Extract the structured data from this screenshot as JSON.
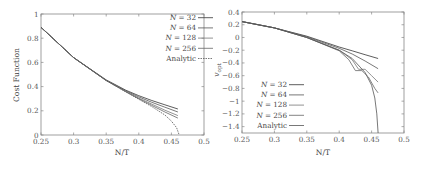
{
  "chart_data": [
    {
      "type": "line",
      "title": "",
      "xlabel": "N/T",
      "ylabel": "Cost Function",
      "xlim": [
        0.25,
        0.5
      ],
      "ylim": [
        0,
        1
      ],
      "xticks": [
        "0.25",
        "0.3",
        "0.35",
        "0.4",
        "0.45",
        "0.5"
      ],
      "yticks": [
        "0",
        "0.2",
        "0.4",
        "0.6",
        "0.8",
        "1"
      ],
      "grid": false,
      "legend_position": "upper right",
      "legend": [
        "N = 32",
        "N = 64",
        "N = 128",
        "N = 256",
        "Analytic"
      ],
      "series": [
        {
          "name": "N = 32",
          "style": "solid",
          "color": "#333333",
          "x": [
            0.25,
            0.3,
            0.35,
            0.38,
            0.4,
            0.42,
            0.44,
            0.46
          ],
          "y": [
            0.89,
            0.64,
            0.455,
            0.37,
            0.325,
            0.285,
            0.25,
            0.215
          ]
        },
        {
          "name": "N = 64",
          "style": "solid",
          "color": "#555555",
          "x": [
            0.25,
            0.3,
            0.35,
            0.38,
            0.4,
            0.42,
            0.44,
            0.46
          ],
          "y": [
            0.89,
            0.64,
            0.452,
            0.365,
            0.315,
            0.27,
            0.23,
            0.19
          ]
        },
        {
          "name": "N = 128",
          "style": "solid",
          "color": "#777777",
          "x": [
            0.25,
            0.3,
            0.35,
            0.38,
            0.4,
            0.42,
            0.44,
            0.46
          ],
          "y": [
            0.89,
            0.64,
            0.45,
            0.36,
            0.305,
            0.255,
            0.205,
            0.16
          ]
        },
        {
          "name": "N = 256",
          "style": "solid",
          "color": "#666666",
          "x": [
            0.25,
            0.3,
            0.35,
            0.38,
            0.4,
            0.42,
            0.44,
            0.46
          ],
          "y": [
            0.89,
            0.64,
            0.45,
            0.358,
            0.3,
            0.245,
            0.19,
            0.14
          ]
        },
        {
          "name": "Analytic",
          "style": "dashed",
          "color": "#555555",
          "x": [
            0.25,
            0.3,
            0.35,
            0.38,
            0.4,
            0.42,
            0.44,
            0.45,
            0.458,
            0.462
          ],
          "y": [
            0.89,
            0.64,
            0.45,
            0.356,
            0.295,
            0.235,
            0.165,
            0.115,
            0.06,
            0.0
          ]
        }
      ]
    },
    {
      "type": "line",
      "title": "",
      "xlabel": "N/T",
      "ylabel": "v_opt",
      "xlim": [
        0.25,
        0.5
      ],
      "ylim": [
        -1.5,
        0.4
      ],
      "xticks": [
        "0.25",
        "0.3",
        "0.35",
        "0.4",
        "0.45",
        "0.5"
      ],
      "yticks": [
        "0.4",
        "0.2",
        "0",
        "-0.2",
        "-0.4",
        "-0.6",
        "-0.8",
        "-1",
        "-1.2",
        "-1.4"
      ],
      "grid": false,
      "legend_position": "lower left",
      "legend": [
        "N = 32",
        "N = 64",
        "N = 128",
        "N = 256",
        "Analytic"
      ],
      "series": [
        {
          "name": "N = 32",
          "style": "solid",
          "color": "#333333",
          "x": [
            0.25,
            0.3,
            0.35,
            0.4,
            0.42,
            0.44,
            0.46
          ],
          "y": [
            0.25,
            0.15,
            0.02,
            -0.15,
            -0.21,
            -0.27,
            -0.33
          ]
        },
        {
          "name": "N = 64",
          "style": "solid",
          "color": "#555555",
          "x": [
            0.25,
            0.3,
            0.35,
            0.4,
            0.42,
            0.44,
            0.46
          ],
          "y": [
            0.25,
            0.15,
            0.01,
            -0.17,
            -0.26,
            -0.37,
            -0.49
          ]
        },
        {
          "name": "N = 128",
          "style": "solid",
          "color": "#777777",
          "x": [
            0.25,
            0.3,
            0.35,
            0.4,
            0.42,
            0.43,
            0.44,
            0.45,
            0.46
          ],
          "y": [
            0.25,
            0.15,
            0.0,
            -0.2,
            -0.35,
            -0.5,
            -0.5,
            -0.6,
            -0.7
          ]
        },
        {
          "name": "N = 256",
          "style": "solid",
          "color": "#666666",
          "x": [
            0.25,
            0.3,
            0.35,
            0.4,
            0.415,
            0.425,
            0.435,
            0.445,
            0.455,
            0.46
          ],
          "y": [
            0.25,
            0.15,
            0.0,
            -0.21,
            -0.35,
            -0.52,
            -0.52,
            -0.62,
            -0.8,
            -0.87
          ]
        },
        {
          "name": "Analytic",
          "style": "solid",
          "color": "#555555",
          "x": [
            0.25,
            0.3,
            0.35,
            0.4,
            0.42,
            0.44,
            0.45,
            0.455,
            0.458,
            0.46
          ],
          "y": [
            0.25,
            0.15,
            0.0,
            -0.2,
            -0.33,
            -0.55,
            -0.75,
            -0.95,
            -1.2,
            -1.5
          ]
        }
      ]
    }
  ],
  "left_plot": {
    "xlabel": "N/T",
    "ylabel": "Cost Function",
    "xticks": [
      "0.25",
      "0.3",
      "0.35",
      "0.4",
      "0.45",
      "0.5"
    ],
    "yticks": [
      "0",
      "0.2",
      "0.4",
      "0.6",
      "0.8",
      "1"
    ],
    "legend": [
      "N = 32",
      "N = 64",
      "N = 128",
      "N = 256",
      "Analytic"
    ]
  },
  "right_plot": {
    "xlabel": "N/T",
    "ylabel": "v",
    "ylabel_sub": "opt",
    "xticks": [
      "0.25",
      "0.3",
      "0.35",
      "0.4",
      "0.45",
      "0.5"
    ],
    "yticks": [
      "0.4",
      "0.2",
      "0",
      "-0.2",
      "-0.4",
      "-0.6",
      "-0.8",
      "-1",
      "-1.2",
      "-1.4"
    ],
    "legend": [
      "N = 32",
      "N = 64",
      "N = 128",
      "N = 256",
      "Analytic"
    ]
  }
}
